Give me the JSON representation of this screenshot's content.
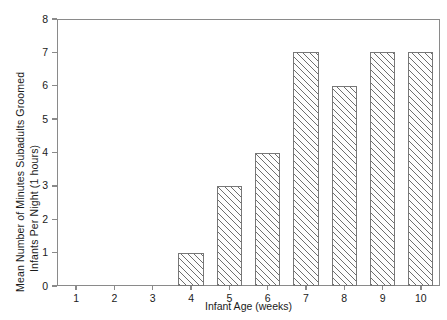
{
  "chart_data": {
    "type": "bar",
    "title": "",
    "subtitle": "",
    "xlabel": "Infant Age (weeks)",
    "ylabel": "Mean Number of Minutes Subadults Groomed Infants Per Night (1 hours)",
    "ylabel_lines": [
      "Mean Number of Minutes Subadults Groomed",
      "Infants Per Night (1 hours)"
    ],
    "categories": [
      "1",
      "2",
      "3",
      "4",
      "5",
      "6",
      "7",
      "8",
      "9",
      "10"
    ],
    "values": [
      0,
      0,
      0,
      1,
      3,
      4,
      7,
      6,
      7,
      7
    ],
    "ylim": [
      0,
      8
    ],
    "yticks": [
      0,
      1,
      2,
      3,
      4,
      5,
      6,
      7,
      8
    ],
    "ytick_labels": [
      "0",
      "1",
      "2",
      "3",
      "4",
      "5",
      "6",
      "7",
      "8"
    ],
    "grid": false,
    "legend": false,
    "legend_position": "none",
    "bar_fill": "diagonal-hatch",
    "bar_edge_color": "#777777",
    "hatch_color": "#6e6e6e",
    "axis_color": "#8a8a8a",
    "background": "#ffffff"
  }
}
